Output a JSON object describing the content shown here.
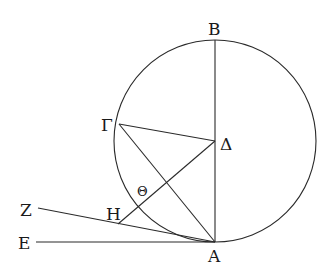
{
  "diagram": {
    "type": "geometry",
    "stroke_color": "#2a2a2a",
    "background": "#ffffff",
    "circle": {
      "cx": 215,
      "cy": 141,
      "r": 101
    },
    "points": {
      "A": {
        "label": "A",
        "x": 215,
        "y": 242
      },
      "B": {
        "label": "B",
        "x": 215,
        "y": 40
      },
      "G": {
        "label": "Γ",
        "x": 119,
        "y": 124
      },
      "D": {
        "label": "Δ",
        "x": 215,
        "y": 141
      },
      "E": {
        "label": "E",
        "x": 36,
        "y": 242
      },
      "Z": {
        "label": "Z",
        "x": 38,
        "y": 208
      },
      "H": {
        "label": "H",
        "x": 118,
        "y": 224
      },
      "Th": {
        "label": "Θ",
        "x": 141,
        "y": 203
      }
    },
    "segments": [
      "AB",
      "ΓΔ",
      "ΓA",
      "HΔ",
      "EA",
      "ZA"
    ]
  }
}
